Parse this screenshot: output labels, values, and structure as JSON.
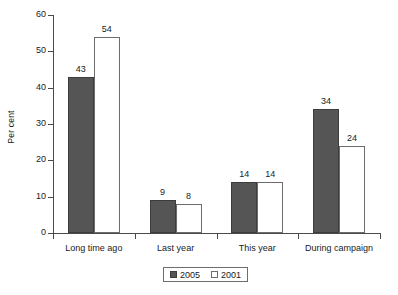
{
  "chart_data": {
    "type": "bar",
    "title": "",
    "subtitle": "",
    "xlabel": "",
    "ylabel": "Per cent",
    "ylim": [
      0,
      60
    ],
    "yticks": [
      0,
      10,
      20,
      30,
      40,
      50,
      60
    ],
    "ytick_labels": [
      "0",
      "10",
      "20",
      "30",
      "40",
      "50",
      "60"
    ],
    "grid": false,
    "legend_position": "bottom-center",
    "categories": [
      "Long time ago",
      "Last year",
      "This year",
      "During campaign"
    ],
    "series": [
      {
        "name": "2005",
        "color": "#555555",
        "border": "#3d3d3d",
        "values": [
          43,
          9,
          14,
          34
        ],
        "labels": [
          "43",
          "9",
          "14",
          "34"
        ]
      },
      {
        "name": "2001",
        "color": "#ffffff",
        "border": "#6d6d6d",
        "values": [
          54,
          8,
          14,
          24
        ],
        "labels": [
          "54",
          "8",
          "14",
          "24"
        ]
      }
    ],
    "legend": [
      {
        "label": "2005",
        "swatch": "filled-dark-square"
      },
      {
        "label": "2001",
        "swatch": "open-white-square"
      }
    ],
    "axis_color": "#4a4a4a",
    "background": "#ffffff"
  }
}
